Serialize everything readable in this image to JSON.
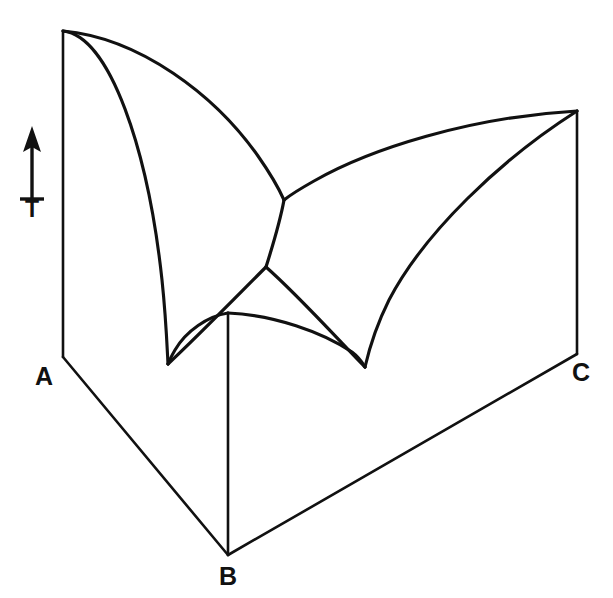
{
  "figure": {
    "kind": "ternary-liquidus-surface-projection",
    "background_color": "#ffffff",
    "line_color": "#111111"
  },
  "axis": {
    "label": "T",
    "icon": "up-arrow-icon",
    "direction": "up",
    "shaft_x": 32,
    "tip_y": 127,
    "base_y": 199,
    "label_x": 32,
    "label_y": 211
  },
  "vertices": [
    {
      "id": "A",
      "label": "A",
      "base_x": 63,
      "base_y": 357,
      "top_x": 63,
      "top_y": 31,
      "label_x": 44,
      "label_y": 378
    },
    {
      "id": "B",
      "label": "B",
      "base_x": 228,
      "base_y": 555,
      "top_x": 228,
      "top_y": 313,
      "label_x": 228,
      "label_y": 578
    },
    {
      "id": "C",
      "label": "C",
      "base_x": 577,
      "base_y": 354,
      "top_x": 577,
      "top_y": 111,
      "label_x": 581,
      "label_y": 374
    }
  ],
  "base_edges": [
    {
      "name": "edge-A-B",
      "from": "A",
      "to": "B",
      "d": "M 63 357 L 228 555"
    },
    {
      "name": "edge-B-C",
      "from": "B",
      "to": "C",
      "d": "M 228 555 L 577 354"
    }
  ],
  "vertical_edges": [
    {
      "name": "vertical-edge-A",
      "d": "M 63 357 L 63 31"
    },
    {
      "name": "vertical-edge-B",
      "d": "M 228 555 L 228 313"
    },
    {
      "name": "vertical-edge-C",
      "d": "M 577 354 L 577 111"
    }
  ],
  "invariant_points": [
    {
      "id": "E_AB",
      "name": "binary-eutectic-A-B",
      "x": 168,
      "y": 364
    },
    {
      "id": "E_BC",
      "name": "binary-eutectic-B-C",
      "x": 365,
      "y": 367
    },
    {
      "id": "E_AC",
      "name": "saddle-junction-A-C",
      "x": 284,
      "y": 200
    },
    {
      "id": "E_T",
      "name": "ternary-eutectic",
      "x": 266,
      "y": 267
    }
  ],
  "liquidus_curves": [
    {
      "name": "liquidus-A-to-eutectic-AB",
      "from": "A-melting-point",
      "to": "E_AB",
      "d": "M 63 31 C 110 36 148 150 162 280 C 166 318 167 345 168 364"
    },
    {
      "name": "liquidus-A-to-saddle-AC",
      "from": "A-melting-point",
      "to": "E_AC",
      "d": "M 63 31 C 140 38 215 95 258 156 C 272 176 280 191 284 200"
    },
    {
      "name": "liquidus-C-to-saddle-AC",
      "from": "C-melting-point",
      "to": "E_AC",
      "d": "M 577 111 C 470 117 370 149 314 181 C 298 190 289 196 284 200"
    },
    {
      "name": "liquidus-C-to-eutectic-BC",
      "from": "C-melting-point",
      "to": "E_BC",
      "d": "M 577 111 C 500 160 424 233 389 300 C 374 330 368 354 365 367"
    },
    {
      "name": "liquidus-B-to-eutectic-AB",
      "from": "B-melting-point",
      "to": "E_AB",
      "d": "M 228 313 C 208 316 186 331 175 350 C 171 357 169 361 168 364"
    },
    {
      "name": "liquidus-B-to-eutectic-BC",
      "from": "B-melting-point",
      "to": "E_BC",
      "d": "M 228 313 C 274 315 322 332 352 352 C 360 358 363 364 365 367"
    }
  ],
  "boundary_curves": [
    {
      "name": "boundary-saddle-to-ternary-eutectic",
      "from": "E_AC",
      "to": "E_T",
      "d": "M 284 200 C 280 222 272 248 266 267"
    },
    {
      "name": "boundary-ternary-eutectic-to-eutectic-AB",
      "from": "E_T",
      "to": "E_AB",
      "d": "M 266 267 C 238 295 196 338 168 364"
    },
    {
      "name": "boundary-ternary-eutectic-to-eutectic-BC",
      "from": "E_T",
      "to": "E_BC",
      "d": "M 266 267 C 300 297 343 345 365 367"
    }
  ]
}
